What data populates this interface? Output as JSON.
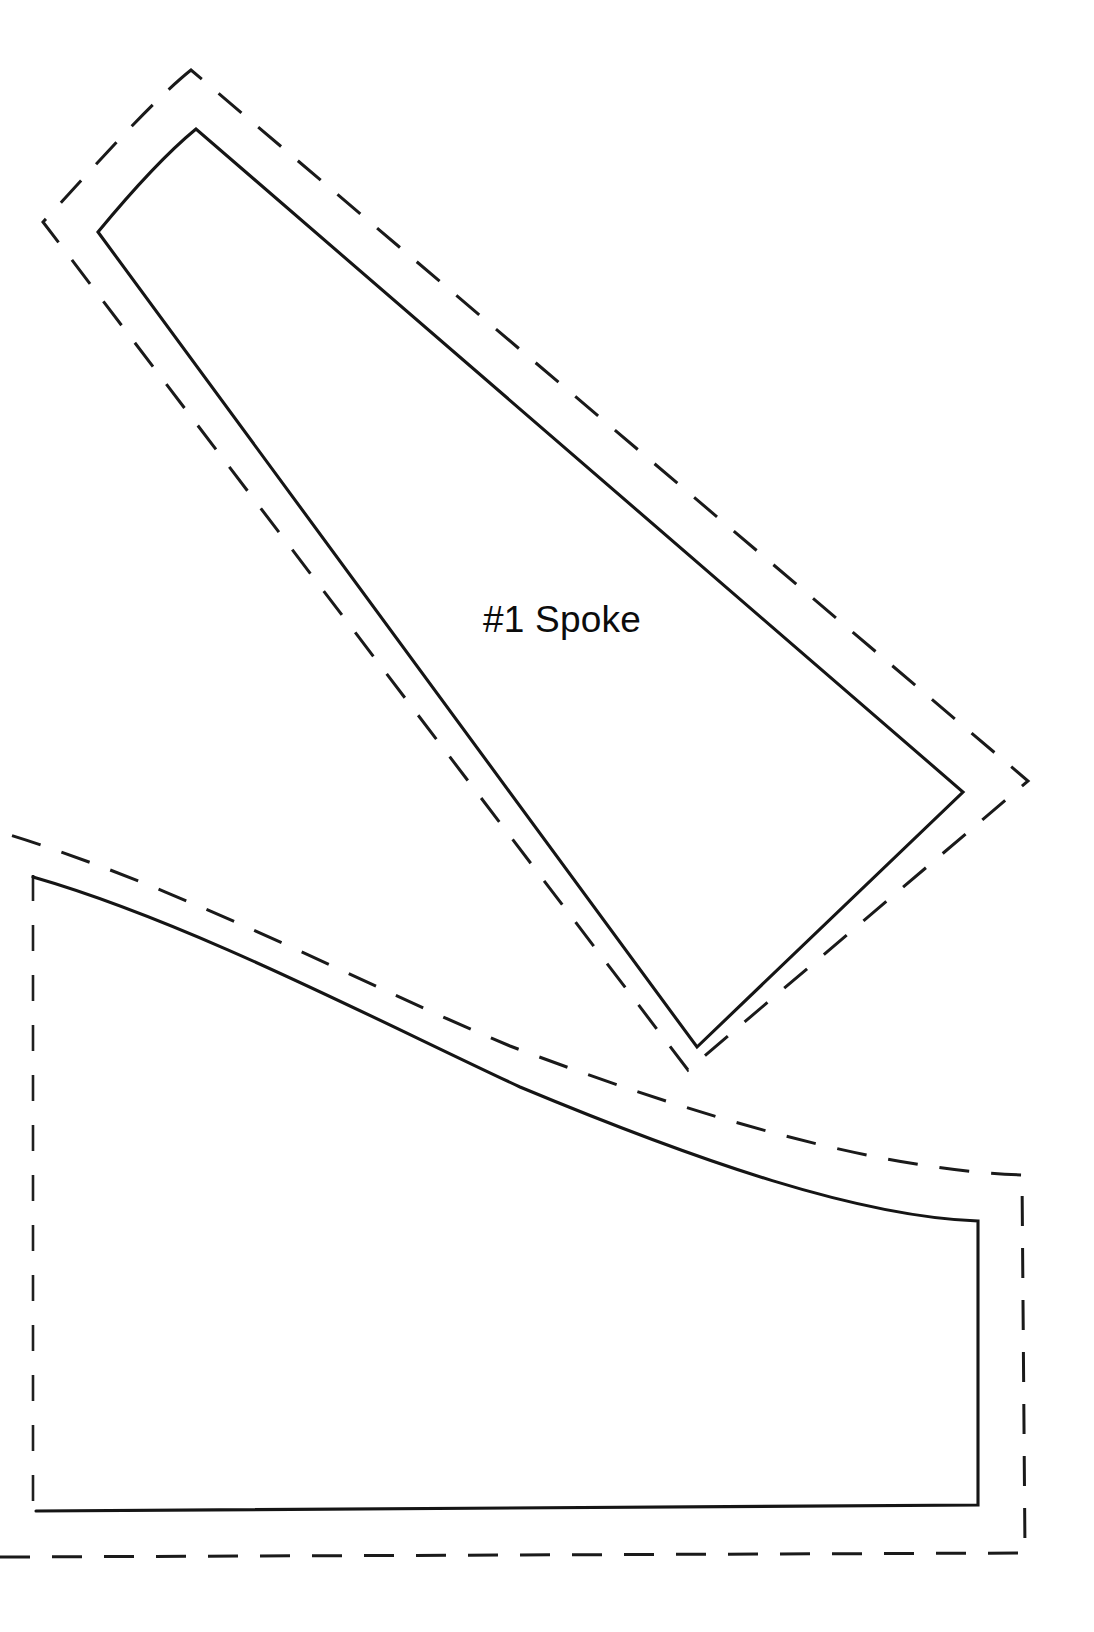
{
  "document": {
    "type": "sewing-pattern-template",
    "background_color": "#ffffff",
    "line_color": "#151515",
    "width": 1094,
    "height": 1632
  },
  "pieces": [
    {
      "id": "spoke-1",
      "label": "#1 Spoke",
      "label_position": {
        "x": 483,
        "y": 632
      },
      "cut_line_style": "solid",
      "seam_line_style": "dashed",
      "cut_line_path": "M 196 129 C 168 152 136 186 98 232 L 697 1047 L 963 792 Z",
      "seam_line_path": "M 191 70 C 150 103 96 165 43 222 L 688 1070 L 1028 781 Z",
      "vertices": {
        "top": [
          196,
          129
        ],
        "left": [
          98,
          232
        ],
        "bottom": [
          697,
          1047
        ],
        "right": [
          963,
          792
        ]
      },
      "seam_vertices": {
        "top": [
          191,
          70
        ],
        "left": [
          43,
          222
        ],
        "bottom": [
          688,
          1070
        ],
        "right": [
          1028,
          781
        ]
      }
    },
    {
      "id": "lower-piece",
      "label": "",
      "cut_line_style": "solid",
      "seam_line_style": "dashed",
      "cut_line_path": "M 36 1511 L 978 1505 L 978 1220 C 860 1215 700 1160 520 1085 C 380 1020 190 920 33 875 L 33 1511 Z",
      "cut_line_visible_path": "M 33 877 C 190 922 380 1022 520 1087 C 700 1162 860 1217 978 1221 L 978 1505 L 36 1511",
      "seam_line_outer_path": "M 0 1557 L 1025 1553 L 1022 1175 C 880 1170 700 1118 510 1046 C 370 988 180 886 0 832",
      "seam_left_vertical_path": "M 33 875 L 33 1511",
      "notes": "solid stitch/cut line with dashed seam allowance offset outward"
    }
  ],
  "labels": [
    {
      "name": "spoke-label",
      "text": "#1 Spoke",
      "x": 483,
      "y": 632
    }
  ]
}
